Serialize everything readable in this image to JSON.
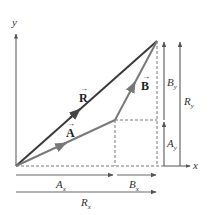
{
  "diagram": {
    "type": "vector-addition",
    "axes": {
      "x_label": "x",
      "y_label": "y"
    },
    "vectors": [
      {
        "name": "A",
        "label": "A",
        "arrow": "→",
        "from": [
          16,
          166
        ],
        "to": [
          115,
          120
        ],
        "color": "#7a7a7a"
      },
      {
        "name": "B",
        "label": "B",
        "arrow": "→",
        "from": [
          115,
          120
        ],
        "to": [
          157,
          41
        ],
        "color": "#7a7a7a"
      },
      {
        "name": "R",
        "label": "R",
        "arrow": "→",
        "from": [
          16,
          166
        ],
        "to": [
          157,
          41
        ],
        "color": "#3a3a3a"
      }
    ],
    "components": {
      "Ax": {
        "base": "A",
        "sub": "x"
      },
      "Bx": {
        "base": "B",
        "sub": "x"
      },
      "Rx": {
        "base": "R",
        "sub": "x"
      },
      "Ay": {
        "base": "A",
        "sub": "y"
      },
      "By": {
        "base": "B",
        "sub": "y"
      },
      "Ry": {
        "base": "R",
        "sub": "y"
      }
    },
    "colors": {
      "resultant": "#3a3a3a",
      "component_vectors": "#7a7a7a",
      "axis": "#555555",
      "dashed": "#555555",
      "text": "#333333"
    }
  }
}
